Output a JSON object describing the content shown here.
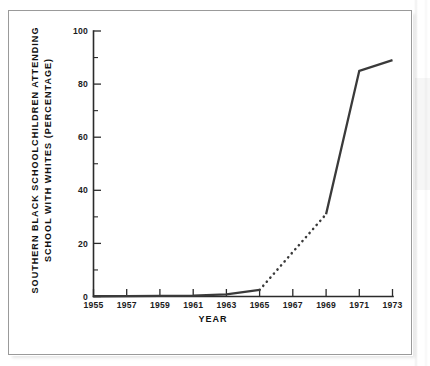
{
  "figure": {
    "background_color": "#ffffff",
    "frame_color": "#9a9a9a",
    "line_color": "#3a3a3a",
    "axis_color": "#2b2b2b",
    "text_color": "#1c1c1c"
  },
  "chart_data": {
    "type": "line",
    "title": "",
    "subtitle": "",
    "xlabel": "YEAR",
    "ylabel": "SOUTHERN BLACK SCHOOLCHILDREN ATTENDING SCHOOL WITH WHITES (PERCENTAGE)",
    "ylabel_line1": "SOUTHERN BLACK SCHOOLCHILDREN ATTENDING",
    "ylabel_line2": "SCHOOL WITH WHITES (PERCENTAGE)",
    "xlim": [
      1955,
      1973
    ],
    "ylim": [
      0,
      100
    ],
    "grid": false,
    "legend": "none",
    "x_ticks": [
      1955,
      1957,
      1959,
      1961,
      1963,
      1965,
      1967,
      1969,
      1971,
      1973
    ],
    "x_tick_labels": [
      "1955",
      "1957",
      "1959",
      "1961",
      "1963",
      "1965",
      "1967",
      "1969",
      "1971",
      "1973"
    ],
    "x_minor_ticks": [
      1956,
      1958,
      1960,
      1962,
      1964,
      1966,
      1968,
      1970,
      1972
    ],
    "y_ticks": [
      0,
      20,
      40,
      60,
      80,
      100
    ],
    "y_tick_labels": [
      "0",
      "20",
      "40",
      "60",
      "80",
      "100"
    ],
    "y_minor_ticks": [
      10,
      30,
      50,
      70,
      90
    ],
    "x": [
      1955,
      1957,
      1959,
      1961,
      1963,
      1965,
      1969,
      1971,
      1973
    ],
    "values": [
      0.1,
      0.15,
      0.2,
      0.35,
      0.8,
      2.5,
      31,
      85,
      89
    ],
    "series": [
      {
        "name": "Southern black schoolchildren attending school with whites",
        "x": [
          1955,
          1957,
          1959,
          1961,
          1963,
          1965,
          1969,
          1971,
          1973
        ],
        "values": [
          0.1,
          0.15,
          0.2,
          0.35,
          0.8,
          2.5,
          31,
          85,
          89
        ],
        "style": "solid",
        "color": "#3a3a3a"
      }
    ],
    "segments": [
      {
        "id": "observed-early",
        "style": "solid",
        "x": [
          1955,
          1957,
          1959,
          1961,
          1963,
          1965
        ],
        "values": [
          0.1,
          0.15,
          0.2,
          0.35,
          0.8,
          2.5
        ]
      },
      {
        "id": "interpolated-gap",
        "style": "dotted",
        "x": [
          1965,
          1969
        ],
        "values": [
          2.5,
          31
        ]
      },
      {
        "id": "observed-late",
        "style": "solid",
        "x": [
          1969,
          1971,
          1973
        ],
        "values": [
          31,
          85,
          89
        ]
      }
    ],
    "annotations": []
  }
}
